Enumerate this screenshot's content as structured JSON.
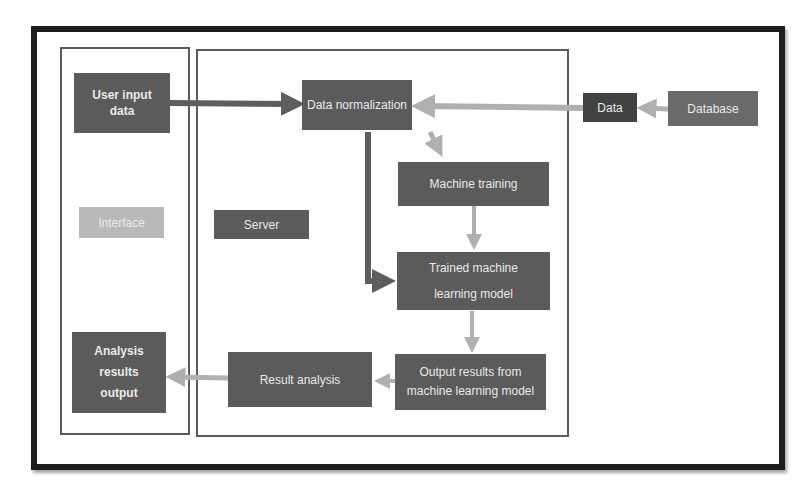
{
  "diagram": {
    "panels": {
      "interface": {
        "label": "Interface"
      },
      "server": {
        "label": "Server"
      }
    },
    "nodes": {
      "user_input": {
        "label": "User input data"
      },
      "analysis_output": {
        "label": "Analysis results output"
      },
      "data_normalization": {
        "label": "Data normalization"
      },
      "machine_training": {
        "label": "Machine training"
      },
      "trained_model": {
        "label": "Trained machine learning model"
      },
      "output_results": {
        "label": "Output results from machine learning model"
      },
      "result_analysis": {
        "label": "Result analysis"
      },
      "data": {
        "label": "Data"
      },
      "database": {
        "label": "Database"
      }
    },
    "edges": [
      {
        "from": "User input data",
        "to": "Data normalization"
      },
      {
        "from": "Database",
        "to": "Data"
      },
      {
        "from": "Data",
        "to": "Data normalization"
      },
      {
        "from": "Data normalization",
        "to": "Machine training"
      },
      {
        "from": "Data normalization",
        "to": "Trained machine learning model"
      },
      {
        "from": "Machine training",
        "to": "Trained machine learning model"
      },
      {
        "from": "Trained machine learning model",
        "to": "Output results from machine learning model"
      },
      {
        "from": "Output results from machine learning model",
        "to": "Result analysis"
      },
      {
        "from": "Result analysis",
        "to": "Analysis results output"
      }
    ],
    "colors": {
      "frame": "#1e1e1e",
      "box_dark": "#5b5b5b",
      "box_darker": "#424242",
      "box_light": "#b9b9b9",
      "arrow_dark": "#5e5e5e",
      "arrow_light": "#b0b0b0"
    }
  }
}
